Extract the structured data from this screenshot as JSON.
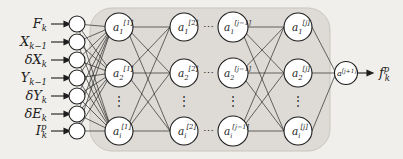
{
  "figure": {
    "background_color": "#f1efeb",
    "panel_color": "#dedbd6",
    "node_fill": "#ffffff",
    "stroke_color": "#1d1d1d"
  },
  "inputs": {
    "label": "input-variables",
    "items": [
      {
        "name": "input-F-k",
        "base": "F",
        "sub": "k",
        "sup": ""
      },
      {
        "name": "input-X-k-1",
        "base": "X",
        "sub": "k−1",
        "sup": ""
      },
      {
        "name": "input-delta-X-k",
        "base": "δX",
        "sub": "k",
        "sup": ""
      },
      {
        "name": "input-Y-k-1",
        "base": "Y",
        "sub": "k−1",
        "sup": ""
      },
      {
        "name": "input-delta-Y-k",
        "base": "δY",
        "sub": "k",
        "sup": ""
      },
      {
        "name": "input-delta-E-k",
        "base": "δE",
        "sub": "k",
        "sup": ""
      },
      {
        "name": "input-I-k-p",
        "base": "I",
        "sub": "k",
        "sup": "p"
      }
    ]
  },
  "hidden_layers": [
    {
      "name": "hidden-layer-1",
      "superscript": "[1]",
      "nodes": [
        {
          "base": "a",
          "sub": "1",
          "sup": "[1]"
        },
        {
          "base": "a",
          "sub": "2",
          "sup": "[1]"
        },
        {
          "base": "a",
          "sub": "i",
          "sup": "[1]"
        }
      ],
      "vertical_ellipsis": "⋮"
    },
    {
      "name": "hidden-layer-2",
      "superscript": "[2]",
      "nodes": [
        {
          "base": "a",
          "sub": "1",
          "sup": "[2]"
        },
        {
          "base": "a",
          "sub": "2",
          "sup": "[2]"
        },
        {
          "base": "a",
          "sub": "i",
          "sup": "[2]"
        }
      ],
      "vertical_ellipsis": "⋮"
    },
    {
      "name": "hidden-layer-j-minus-1",
      "superscript": "[j−1]",
      "nodes": [
        {
          "base": "a",
          "sub": "1",
          "sup": "[j−1]"
        },
        {
          "base": "a",
          "sub": "2",
          "sup": "[j−1]"
        },
        {
          "base": "a",
          "sub": "i",
          "sup": "[j−1]"
        }
      ],
      "vertical_ellipsis": "⋮"
    },
    {
      "name": "hidden-layer-j",
      "superscript": "[j]",
      "nodes": [
        {
          "base": "a",
          "sub": "1",
          "sup": "[j]"
        },
        {
          "base": "a",
          "sub": "2",
          "sup": "[j]"
        },
        {
          "base": "a",
          "sub": "i",
          "sup": "[j]"
        }
      ],
      "vertical_ellipsis": "⋮"
    }
  ],
  "layer_gap_ellipsis": {
    "name": "horizontal-ellipsis",
    "glyph": "⋯",
    "rows": 3
  },
  "output_node": {
    "name": "output-node",
    "base": "a",
    "sup": "[j+1]",
    "sub": ""
  },
  "output_label": {
    "name": "output-f-k-p",
    "base": "f",
    "sub": "k",
    "sup": "p"
  }
}
